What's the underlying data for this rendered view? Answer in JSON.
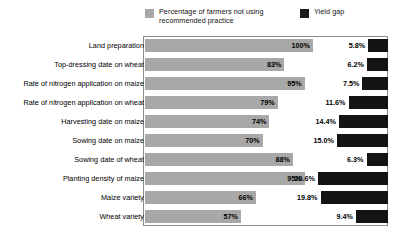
{
  "legend": {
    "entries": [
      {
        "label": "Percentage of farmers not using\nrecommended practice",
        "color": "#a8a8a8",
        "swatch_name": "legend-swatch-percentage"
      },
      {
        "label": "Yield gap",
        "color": "#1c1c1c",
        "swatch_name": "legend-swatch-yield-gap"
      }
    ]
  },
  "chart_data": {
    "type": "bar",
    "orientation": "horizontal",
    "title": "",
    "subtitle": "",
    "xlabel": "",
    "ylabel": "",
    "grid": false,
    "legend_position": "top",
    "categories": [
      "Land preparation",
      "Top-dressing date on wheat",
      "Rate of nitrogen application on maize",
      "Rate of nitrogen application on wheat",
      "Harvesting date on maize",
      "Sowing date on maize",
      "Sowing date of wheat",
      "Planting density of maize",
      "Maize variety",
      "Wheat variety"
    ],
    "series": [
      {
        "name": "Percentage of farmers not using recommended practice",
        "color": "#a8a8a8",
        "unit": "%",
        "align": "left",
        "axis_max": 100,
        "values": [
          100,
          83,
          95,
          79,
          74,
          70,
          88,
          95,
          66,
          57
        ],
        "labels": [
          "100%",
          "83%",
          "95%",
          "79%",
          "74%",
          "70%",
          "88%",
          "95%",
          "66%",
          "57%"
        ]
      },
      {
        "name": "Yield gap",
        "color": "#141414",
        "unit": "%",
        "align": "right",
        "axis_max": 22,
        "values": [
          5.8,
          6.2,
          7.5,
          11.6,
          14.4,
          15.0,
          6.3,
          20.6,
          19.8,
          9.4
        ],
        "labels": [
          "5.8%",
          "6.2%",
          "7.5%",
          "11.6%",
          "14.4%",
          "15.0%",
          "6.3%",
          "20.6%",
          "19.8%",
          "9.4%"
        ]
      }
    ]
  }
}
